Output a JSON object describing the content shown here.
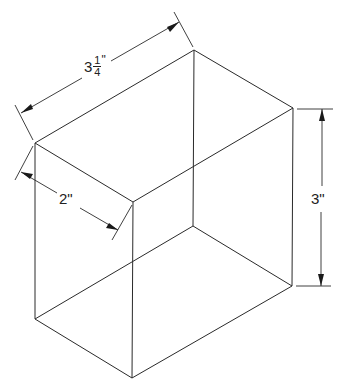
{
  "diagram": {
    "type": "isometric-box-with-dimensions",
    "colors": {
      "line": "#2a2a2a",
      "background": "#ffffff"
    },
    "vertices": {
      "top_left": [
        35,
        143
      ],
      "top_back": [
        194,
        50
      ],
      "top_right": [
        293,
        108
      ],
      "top_front": [
        133,
        202
      ],
      "bottom_left": [
        35,
        319
      ],
      "bottom_back": [
        193,
        226
      ],
      "bottom_right": [
        292,
        286
      ],
      "bottom_front": [
        132,
        378
      ]
    },
    "dimensions": {
      "width": {
        "whole": "3",
        "numerator": "1",
        "denominator": "4",
        "unit": "\"",
        "label": "3 1/4\""
      },
      "depth": {
        "label": "2\""
      },
      "height": {
        "label": "3\""
      }
    }
  }
}
